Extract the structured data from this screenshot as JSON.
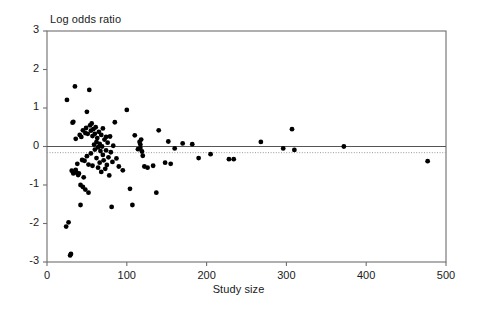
{
  "chart_data": {
    "type": "scatter",
    "title": "",
    "xlabel": "Study size",
    "ylabel": "Log odds ratio",
    "ylabel_position": "top-left",
    "xlim": [
      0,
      500
    ],
    "ylim": [
      -3,
      3
    ],
    "xticks": [
      0,
      100,
      200,
      300,
      400,
      500
    ],
    "yticks": [
      -3,
      -2,
      -1,
      0,
      1,
      2,
      3
    ],
    "xtick_labels": [
      "0",
      "100",
      "200",
      "300",
      "400",
      "500"
    ],
    "ytick_labels": [
      "-3",
      "-2",
      "-1",
      "0",
      "1",
      "2",
      "3"
    ],
    "grid": false,
    "legend": null,
    "marker": {
      "shape": "circle",
      "color": "#000000",
      "size_px": 3.6
    },
    "reference_lines": [
      {
        "name": "zero-line",
        "orientation": "horizontal",
        "y": 0,
        "style": "solid",
        "color": "#555555",
        "width_px": 1.2
      },
      {
        "name": "pooled-estimate-line",
        "orientation": "horizontal",
        "y": -0.16,
        "style": "dotted",
        "color": "#999999",
        "width_px": 1
      }
    ],
    "points": [
      [
        25,
        1.21
      ],
      [
        24,
        -2.08
      ],
      [
        27,
        -1.97
      ],
      [
        29,
        -2.83
      ],
      [
        30,
        -2.79
      ],
      [
        31,
        -0.63
      ],
      [
        32,
        0.62
      ],
      [
        33,
        0.64
      ],
      [
        33,
        -0.7
      ],
      [
        35,
        1.56
      ],
      [
        36,
        0.2
      ],
      [
        36,
        -0.61
      ],
      [
        37,
        -0.68
      ],
      [
        38,
        -0.45
      ],
      [
        39,
        -0.74
      ],
      [
        40,
        -0.7
      ],
      [
        41,
        0.3
      ],
      [
        42,
        -1.0
      ],
      [
        42,
        -1.52
      ],
      [
        43,
        0.25
      ],
      [
        44,
        -0.35
      ],
      [
        45,
        -1.05
      ],
      [
        45,
        0.42
      ],
      [
        46,
        -0.8
      ],
      [
        47,
        -0.37
      ],
      [
        48,
        0.35
      ],
      [
        48,
        -1.12
      ],
      [
        49,
        0.48
      ],
      [
        50,
        0.9
      ],
      [
        50,
        -0.25
      ],
      [
        51,
        0.33
      ],
      [
        52,
        -0.47
      ],
      [
        52,
        -1.2
      ],
      [
        53,
        1.47
      ],
      [
        54,
        0.55
      ],
      [
        55,
        0.41
      ],
      [
        55,
        -0.18
      ],
      [
        56,
        0.6
      ],
      [
        57,
        0.27
      ],
      [
        57,
        -0.5
      ],
      [
        58,
        0.45
      ],
      [
        59,
        0.05
      ],
      [
        60,
        0.33
      ],
      [
        60,
        -0.08
      ],
      [
        61,
        0.5
      ],
      [
        62,
        0.12
      ],
      [
        62,
        -0.3
      ],
      [
        63,
        0.22
      ],
      [
        64,
        -0.02
      ],
      [
        64,
        -0.55
      ],
      [
        65,
        0.38
      ],
      [
        66,
        0.07
      ],
      [
        66,
        -0.42
      ],
      [
        67,
        -0.12
      ],
      [
        68,
        0.3
      ],
      [
        68,
        -0.66
      ],
      [
        69,
        0.0
      ],
      [
        70,
        0.47
      ],
      [
        70,
        -0.22
      ],
      [
        71,
        -0.36
      ],
      [
        72,
        0.18
      ],
      [
        73,
        -0.58
      ],
      [
        74,
        0.25
      ],
      [
        74,
        -0.1
      ],
      [
        75,
        -0.48
      ],
      [
        76,
        0.1
      ],
      [
        77,
        -0.28
      ],
      [
        78,
        -0.75
      ],
      [
        79,
        0.26
      ],
      [
        80,
        -0.15
      ],
      [
        81,
        -1.57
      ],
      [
        82,
        -0.4
      ],
      [
        83,
        0.02
      ],
      [
        85,
        0.63
      ],
      [
        87,
        -0.31
      ],
      [
        90,
        -0.52
      ],
      [
        95,
        -0.62
      ],
      [
        100,
        0.95
      ],
      [
        104,
        -1.1
      ],
      [
        107,
        -1.52
      ],
      [
        110,
        0.29
      ],
      [
        114,
        -0.07
      ],
      [
        116,
        0.12
      ],
      [
        117,
        0.05
      ],
      [
        117,
        -0.04
      ],
      [
        118,
        0.18
      ],
      [
        119,
        -0.13
      ],
      [
        120,
        -0.24
      ],
      [
        122,
        -0.52
      ],
      [
        126,
        -0.55
      ],
      [
        133,
        -0.5
      ],
      [
        137,
        -1.2
      ],
      [
        140,
        0.42
      ],
      [
        148,
        -0.42
      ],
      [
        152,
        0.13
      ],
      [
        155,
        -0.45
      ],
      [
        160,
        -0.05
      ],
      [
        170,
        0.08
      ],
      [
        182,
        0.06
      ],
      [
        190,
        -0.3
      ],
      [
        205,
        -0.2
      ],
      [
        228,
        -0.33
      ],
      [
        234,
        -0.33
      ],
      [
        268,
        0.12
      ],
      [
        296,
        -0.05
      ],
      [
        307,
        0.45
      ],
      [
        310,
        -0.09
      ],
      [
        372,
        0.0
      ],
      [
        477,
        -0.38
      ]
    ]
  },
  "plot_box": {
    "left_px": 47,
    "top_px": 31,
    "right_px": 446,
    "bottom_px": 262
  }
}
